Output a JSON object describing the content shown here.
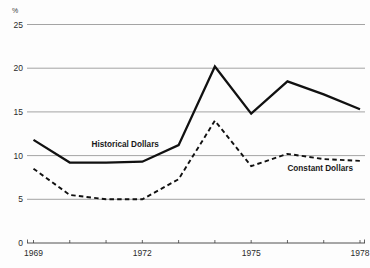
{
  "chart_data": {
    "type": "line",
    "title": "",
    "subtitle": "",
    "xlabel": "",
    "ylabel": "%",
    "unit_label": "%",
    "x": [
      1969,
      1970,
      1971,
      1972,
      1973,
      1974,
      1975,
      1976,
      1977,
      1978
    ],
    "xtick_labels": [
      "1969",
      "1972",
      "1975",
      "1978"
    ],
    "xtick_values": [
      1969,
      1972,
      1975,
      1978
    ],
    "xlim": [
      1969,
      1978
    ],
    "ytick_labels": [
      "0",
      "5",
      "10",
      "15",
      "20",
      "25"
    ],
    "ytick_values": [
      0,
      5,
      10,
      15,
      20,
      25
    ],
    "ylim": [
      0,
      25
    ],
    "grid": true,
    "grid_axis": "y",
    "legend": "inline-annotations",
    "series": [
      {
        "name": "Historical Dollars",
        "style": "solid",
        "label_x": 1970.6,
        "label_y": 11.0,
        "values": [
          11.8,
          9.2,
          9.2,
          9.3,
          11.2,
          20.2,
          14.8,
          18.5,
          17.0,
          15.3
        ]
      },
      {
        "name": "Constant Dollars",
        "style": "dashed",
        "label_x": 1976.0,
        "label_y": 8.2,
        "values": [
          8.5,
          5.5,
          5.0,
          5.0,
          7.3,
          14.0,
          8.8,
          10.2,
          9.6,
          9.4
        ]
      }
    ],
    "annotations": [
      {
        "text": "Historical Dollars",
        "x": 1970.6,
        "y": 11.0
      },
      {
        "text": "Constant Dollars",
        "x": 1976.0,
        "y": 8.2
      }
    ]
  }
}
